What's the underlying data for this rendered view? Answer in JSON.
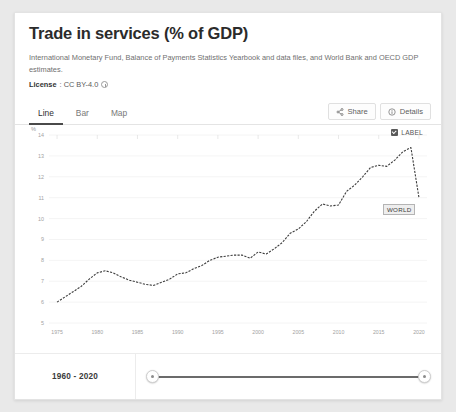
{
  "header": {
    "title": "Trade in services (% of GDP)",
    "source": "International Monetary Fund, Balance of Payments Statistics Yearbook and data files, and World Bank and OECD GDP estimates.",
    "license_label": "License",
    "license_value": ": CC BY-4.0"
  },
  "tabs": [
    {
      "label": "Line",
      "active": true
    },
    {
      "label": "Bar",
      "active": false
    },
    {
      "label": "Map",
      "active": false
    }
  ],
  "actions": {
    "share": "Share",
    "details": "Details"
  },
  "chart_controls": {
    "label_toggle": "LABEL",
    "label_checked": true,
    "series_tag": "WORLD"
  },
  "footer": {
    "range_label": "1960 - 2020"
  },
  "chart_data": {
    "type": "line",
    "title": "Trade in services (% of GDP)",
    "xlabel": "",
    "ylabel": "%",
    "yunit": "%",
    "xlim": [
      1974,
      2021
    ],
    "ylim": [
      5,
      14
    ],
    "yticks": [
      14,
      13,
      12,
      11,
      10,
      9,
      8,
      7,
      6,
      5
    ],
    "xticks": [
      1975,
      1980,
      1985,
      1990,
      1995,
      2000,
      2005,
      2010,
      2015,
      2020
    ],
    "grid": true,
    "legend": "WORLD",
    "series": [
      {
        "name": "WORLD",
        "x": [
          1975,
          1976,
          1977,
          1978,
          1979,
          1980,
          1981,
          1982,
          1983,
          1984,
          1985,
          1986,
          1987,
          1988,
          1989,
          1990,
          1991,
          1992,
          1993,
          1994,
          1995,
          1996,
          1997,
          1998,
          1999,
          2000,
          2001,
          2002,
          2003,
          2004,
          2005,
          2006,
          2007,
          2008,
          2009,
          2010,
          2011,
          2012,
          2013,
          2014,
          2015,
          2016,
          2017,
          2018,
          2019,
          2020
        ],
        "values": [
          6.0,
          6.25,
          6.5,
          6.75,
          7.1,
          7.4,
          7.5,
          7.4,
          7.2,
          7.05,
          6.95,
          6.85,
          6.8,
          6.95,
          7.1,
          7.35,
          7.4,
          7.6,
          7.75,
          8.0,
          8.15,
          8.2,
          8.25,
          8.25,
          8.1,
          8.4,
          8.3,
          8.55,
          8.85,
          9.3,
          9.5,
          9.85,
          10.35,
          10.7,
          10.6,
          10.65,
          11.3,
          11.6,
          12.0,
          12.45,
          12.55,
          12.5,
          12.8,
          13.2,
          13.4,
          11.0
        ]
      }
    ]
  }
}
